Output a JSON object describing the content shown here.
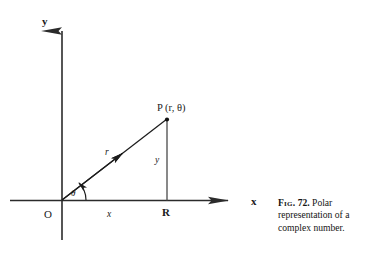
{
  "figure": {
    "axes": {
      "y_axis_label": "y",
      "x_axis_label": "x",
      "origin_label": "O"
    },
    "points": {
      "p_label": "P (r, θ)",
      "foot_label": "R"
    },
    "segments": {
      "radius_label": "r",
      "horizontal_label": "x",
      "vertical_label": "y",
      "angle_label": "θ"
    },
    "colors": {
      "ink": "#1a1a1a",
      "line": "#2b2b2b",
      "background": "#ffffff"
    }
  },
  "caption": {
    "fig_tag": "Fig.",
    "fig_number": "72.",
    "text": "Polar representation of a complex number."
  }
}
